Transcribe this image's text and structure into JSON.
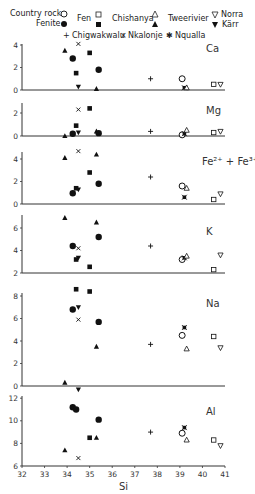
{
  "chart_data": {
    "type": "scatter",
    "title": "",
    "xlabel": "Si",
    "xlim": [
      32,
      41
    ],
    "xticks": [
      32,
      33,
      34,
      35,
      36,
      37,
      38,
      39,
      40,
      41
    ],
    "legend": [
      {
        "name": "Country rock",
        "marker": "open-circle"
      },
      {
        "name": "Fenite",
        "marker": "filled-circle"
      },
      {
        "name": "Fen (country rock)",
        "label": "Fen",
        "marker": "open-square"
      },
      {
        "name": "Fen (fenite)",
        "marker": "filled-square"
      },
      {
        "name": "Chishanya (country rock)",
        "label": "Chishanya",
        "marker": "open-triangle"
      },
      {
        "name": "Chishanya (fenite)",
        "marker": "filled-triangle"
      },
      {
        "name": "Tweerivier",
        "label": "Tweerivier",
        "marker": "none"
      },
      {
        "name": "Norra Kärr (country rock)",
        "label": "Norra",
        "marker": "open-down-triangle"
      },
      {
        "name": "Norra Kärr (fenite)",
        "label": "Kärr",
        "marker": "filled-down-triangle"
      },
      {
        "name": "Chigwakwalu",
        "marker": "plus"
      },
      {
        "name": "Nkalonje",
        "marker": "cross"
      },
      {
        "name": "Nqualla",
        "marker": "star"
      }
    ],
    "panels": [
      {
        "label": "Ca",
        "ylim": [
          0,
          5
        ],
        "yticks": [
          0,
          2,
          4
        ],
        "points": [
          {
            "series": "Chishanya (fenite)",
            "x": 33.9,
            "y": 3.5
          },
          {
            "series": "Nkalonje",
            "x": 34.5,
            "y": 4.1
          },
          {
            "series": "Fenite",
            "x": 34.25,
            "y": 2.8
          },
          {
            "series": "Fen (fenite)",
            "x": 35.0,
            "y": 3.3
          },
          {
            "series": "Fen (fenite)",
            "x": 34.4,
            "y": 1.5
          },
          {
            "series": "Fenite",
            "x": 35.4,
            "y": 1.8
          },
          {
            "series": "Norra Kärr (fenite)",
            "x": 34.5,
            "y": 0.3
          },
          {
            "series": "Chishanya (fenite)",
            "x": 35.3,
            "y": 0.1
          },
          {
            "series": "Chigwakwalu",
            "x": 37.7,
            "y": 1.0
          },
          {
            "series": "Country rock",
            "x": 39.1,
            "y": 1.0
          },
          {
            "series": "Nqualla",
            "x": 39.2,
            "y": 0.2
          },
          {
            "series": "Chishanya (country rock)",
            "x": 39.3,
            "y": 0.2
          },
          {
            "series": "Fen (country rock)",
            "x": 40.5,
            "y": 0.5
          },
          {
            "series": "Norra Kärr (country rock)",
            "x": 40.8,
            "y": 0.5
          }
        ]
      },
      {
        "label": "Mg",
        "ylim": [
          0,
          2.8
        ],
        "yticks": [
          0,
          2
        ],
        "points": [
          {
            "series": "Nkalonje",
            "x": 34.5,
            "y": 2.3
          },
          {
            "series": "Fen (fenite)",
            "x": 35.0,
            "y": 2.4
          },
          {
            "series": "Fen (fenite)",
            "x": 34.4,
            "y": 0.9
          },
          {
            "series": "Chishanya (fenite)",
            "x": 33.9,
            "y": 0.0
          },
          {
            "series": "Fenite",
            "x": 34.25,
            "y": 0.2
          },
          {
            "series": "Norra Kärr (fenite)",
            "x": 34.5,
            "y": 0.3
          },
          {
            "series": "Chishanya (fenite)",
            "x": 35.3,
            "y": 0.4
          },
          {
            "series": "Fenite",
            "x": 35.4,
            "y": 0.25
          },
          {
            "series": "Chigwakwalu",
            "x": 37.7,
            "y": 0.4
          },
          {
            "series": "Country rock",
            "x": 39.1,
            "y": 0.1
          },
          {
            "series": "Nqualla",
            "x": 39.2,
            "y": 0.2
          },
          {
            "series": "Chishanya (country rock)",
            "x": 39.3,
            "y": 0.5
          },
          {
            "series": "Fen (country rock)",
            "x": 40.5,
            "y": 0.3
          },
          {
            "series": "Norra Kärr (country rock)",
            "x": 40.8,
            "y": 0.4
          }
        ]
      },
      {
        "label": "Fe²⁺ + Fe³⁺",
        "ylim": [
          0,
          5
        ],
        "yticks": [
          0,
          2,
          4
        ],
        "points": [
          {
            "series": "Chishanya (fenite)",
            "x": 33.9,
            "y": 4.1
          },
          {
            "series": "Nkalonje",
            "x": 34.5,
            "y": 4.7
          },
          {
            "series": "Chishanya (fenite)",
            "x": 35.3,
            "y": 4.4
          },
          {
            "series": "Fen (fenite)",
            "x": 35.0,
            "y": 2.8
          },
          {
            "series": "Fenite",
            "x": 35.4,
            "y": 1.8
          },
          {
            "series": "Fen (fenite)",
            "x": 34.4,
            "y": 1.4
          },
          {
            "series": "Norra Kärr (fenite)",
            "x": 34.5,
            "y": 1.3
          },
          {
            "series": "Fenite",
            "x": 34.25,
            "y": 0.95
          },
          {
            "series": "Chigwakwalu",
            "x": 37.7,
            "y": 2.4
          },
          {
            "series": "Country rock",
            "x": 39.1,
            "y": 1.6
          },
          {
            "series": "Chishanya (country rock)",
            "x": 39.3,
            "y": 1.4
          },
          {
            "series": "Nqualla",
            "x": 39.2,
            "y": 0.6
          },
          {
            "series": "Fen (country rock)",
            "x": 40.5,
            "y": 0.4
          },
          {
            "series": "Norra Kärr (country rock)",
            "x": 40.8,
            "y": 0.9
          }
        ]
      },
      {
        "label": "K",
        "ylim": [
          2,
          7
        ],
        "yticks": [
          2,
          4,
          6
        ],
        "points": [
          {
            "series": "Chishanya (fenite)",
            "x": 33.9,
            "y": 6.9
          },
          {
            "series": "Chishanya (fenite)",
            "x": 35.3,
            "y": 6.5
          },
          {
            "series": "Fenite",
            "x": 35.4,
            "y": 5.2
          },
          {
            "series": "Fenite",
            "x": 34.25,
            "y": 4.4
          },
          {
            "series": "Nkalonje",
            "x": 34.5,
            "y": 4.2
          },
          {
            "series": "Fen (fenite)",
            "x": 34.4,
            "y": 3.2
          },
          {
            "series": "Norra Kärr (fenite)",
            "x": 34.5,
            "y": 3.35
          },
          {
            "series": "Fen (fenite)",
            "x": 35.0,
            "y": 2.55
          },
          {
            "series": "Chigwakwalu",
            "x": 37.7,
            "y": 4.4
          },
          {
            "series": "Country rock",
            "x": 39.1,
            "y": 3.2
          },
          {
            "series": "Nqualla",
            "x": 39.2,
            "y": 3.35
          },
          {
            "series": "Chishanya (country rock)",
            "x": 39.3,
            "y": 3.5
          },
          {
            "series": "Fen (country rock)",
            "x": 40.5,
            "y": 2.3
          },
          {
            "series": "Norra Kärr (country rock)",
            "x": 40.8,
            "y": 3.6
          }
        ]
      },
      {
        "label": "Na",
        "ylim": [
          0,
          9
        ],
        "yticks": [
          0,
          2,
          4,
          6,
          8
        ],
        "points": [
          {
            "series": "Fen (fenite)",
            "x": 34.4,
            "y": 8.6
          },
          {
            "series": "Fen (fenite)",
            "x": 35.0,
            "y": 8.4
          },
          {
            "series": "Fenite",
            "x": 34.25,
            "y": 6.8
          },
          {
            "series": "Norra Kärr (fenite)",
            "x": 34.5,
            "y": 7.0
          },
          {
            "series": "Nkalonje",
            "x": 34.5,
            "y": 5.9
          },
          {
            "series": "Fenite",
            "x": 35.4,
            "y": 5.7
          },
          {
            "series": "Chishanya (fenite)",
            "x": 35.3,
            "y": 3.5
          },
          {
            "series": "Chishanya (fenite)",
            "x": 33.9,
            "y": 0.3
          },
          {
            "series": "Norra Kärr (fenite)",
            "x": 34.5,
            "y": -0.3
          },
          {
            "series": "Chigwakwalu",
            "x": 37.7,
            "y": 3.7
          },
          {
            "series": "Country rock",
            "x": 39.1,
            "y": 4.5
          },
          {
            "series": "Nqualla",
            "x": 39.2,
            "y": 5.2
          },
          {
            "series": "Chishanya (country rock)",
            "x": 39.3,
            "y": 3.3
          },
          {
            "series": "Fen (country rock)",
            "x": 40.5,
            "y": 4.4
          },
          {
            "series": "Norra Kärr (country rock)",
            "x": 40.8,
            "y": 3.4
          }
        ]
      },
      {
        "label": "Al",
        "ylim": [
          6,
          12
        ],
        "yticks": [
          6,
          8,
          10,
          12
        ],
        "points": [
          {
            "series": "Fenite",
            "x": 34.25,
            "y": 11.2
          },
          {
            "series": "Fenite",
            "x": 34.4,
            "y": 11.0
          },
          {
            "series": "Fenite",
            "x": 35.4,
            "y": 10.1
          },
          {
            "series": "Fen (fenite)",
            "x": 35.0,
            "y": 8.5
          },
          {
            "series": "Chishanya (fenite)",
            "x": 35.3,
            "y": 8.5
          },
          {
            "series": "Chishanya (fenite)",
            "x": 33.9,
            "y": 7.4
          },
          {
            "series": "Nkalonje",
            "x": 34.5,
            "y": 6.7
          },
          {
            "series": "Chigwakwalu",
            "x": 37.7,
            "y": 9.0
          },
          {
            "series": "Country rock",
            "x": 39.1,
            "y": 8.9
          },
          {
            "series": "Nqualla",
            "x": 39.2,
            "y": 9.4
          },
          {
            "series": "Chishanya (country rock)",
            "x": 39.3,
            "y": 8.3
          },
          {
            "series": "Fen (country rock)",
            "x": 40.5,
            "y": 8.3
          },
          {
            "series": "Norra Kärr (country rock)",
            "x": 40.8,
            "y": 7.8
          }
        ]
      }
    ]
  },
  "legend_labels": {
    "country_rock": "Country rock",
    "fenite": "Fenite",
    "fen": "Fen",
    "chishanya": "Chishanya",
    "tweerivier": "Tweerivier",
    "norra": "Norra",
    "karr": "Kärr",
    "chigwakwalu": "Chigwakwalu",
    "nkalonje": "Nkalonje",
    "nqualla": "Nqualla"
  },
  "axis": {
    "xlabel": "Si",
    "xtick_labels": [
      "32",
      "33",
      "34",
      "35",
      "36",
      "37",
      "38",
      "39",
      "40",
      "41"
    ]
  },
  "panel_labels": [
    "Ca",
    "Mg",
    "Fe²⁺ + Fe³⁺",
    "K",
    "Na",
    "Al"
  ]
}
